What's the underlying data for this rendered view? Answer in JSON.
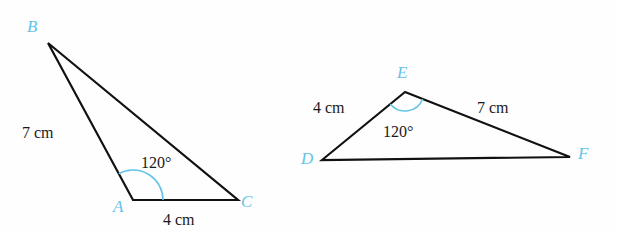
{
  "figure": {
    "background_color": "#fefefe",
    "stroke_color": "#111111",
    "accent_color": "#63c3e8",
    "label_color": "#1a1a1a",
    "stroke_width": 2.2
  },
  "triangles": [
    {
      "id": "triangle-abc",
      "name": "triangle-abc",
      "vertices": [
        {
          "id": "B",
          "label": "B",
          "x": 48,
          "y": 43,
          "label_x": 27,
          "label_y": 18
        },
        {
          "id": "A",
          "label": "A",
          "x": 133,
          "y": 200,
          "label_x": 113,
          "label_y": 198
        },
        {
          "id": "C",
          "label": "C",
          "x": 238,
          "y": 200,
          "label_x": 241,
          "label_y": 193
        }
      ],
      "sides": [
        {
          "from": "B",
          "to": "A",
          "length_label": "7 cm",
          "label_x": 22,
          "label_y": 125
        },
        {
          "from": "A",
          "to": "C",
          "length_label": "4 cm",
          "label_x": 163,
          "label_y": 212
        },
        {
          "from": "B",
          "to": "C",
          "length_label": "",
          "label_x": 0,
          "label_y": 0
        }
      ],
      "angle": {
        "at": "A",
        "value_label": "120°",
        "label_x": 141,
        "label_y": 155,
        "arc_radius": 30,
        "arc_color": "#63c3e8"
      }
    },
    {
      "id": "triangle-def",
      "name": "triangle-def",
      "vertices": [
        {
          "id": "E",
          "label": "E",
          "x": 405,
          "y": 92,
          "label_x": 397,
          "label_y": 64
        },
        {
          "id": "D",
          "label": "D",
          "x": 322,
          "y": 160,
          "label_x": 301,
          "label_y": 150
        },
        {
          "id": "F",
          "label": "F",
          "x": 570,
          "y": 157,
          "label_x": 578,
          "label_y": 145
        }
      ],
      "sides": [
        {
          "from": "D",
          "to": "E",
          "length_label": "4 cm",
          "label_x": 313,
          "label_y": 100
        },
        {
          "from": "E",
          "to": "F",
          "length_label": "7 cm",
          "label_x": 477,
          "label_y": 100
        },
        {
          "from": "D",
          "to": "F",
          "length_label": "",
          "label_x": 0,
          "label_y": 0
        }
      ],
      "angle": {
        "at": "E",
        "value_label": "120°",
        "label_x": 383,
        "label_y": 124,
        "arc_radius": 19,
        "arc_color": "#63c3e8"
      }
    }
  ]
}
